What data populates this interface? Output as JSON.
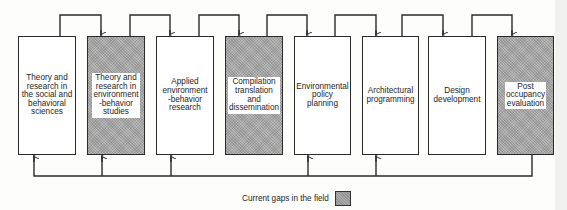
{
  "diagram": {
    "boxes": [
      {
        "label": "Theory and\nresearch in\nthe social and\nbehavioral\nsciences",
        "gap": false
      },
      {
        "label": "Theory and\nresearch in\nenvironment\n-behavior\nstudies",
        "gap": true
      },
      {
        "label": "Applied\nenvironment\n-behavior\nresearch",
        "gap": false
      },
      {
        "label": "Compilation\ntranslation\nand\ndissemination",
        "gap": true
      },
      {
        "label": "Environmental\npolicy\nplanning",
        "gap": false
      },
      {
        "label": "Architectural\nprogramming",
        "gap": false
      },
      {
        "label": "Design\ndevelopment",
        "gap": false
      },
      {
        "label": "Post\noccupancy\nevaluation",
        "gap": true
      }
    ],
    "legend": {
      "label": "Current gaps in the field"
    },
    "colors": {
      "gap_fill": "#a9a9a9",
      "line": "#2a2a2a"
    }
  }
}
